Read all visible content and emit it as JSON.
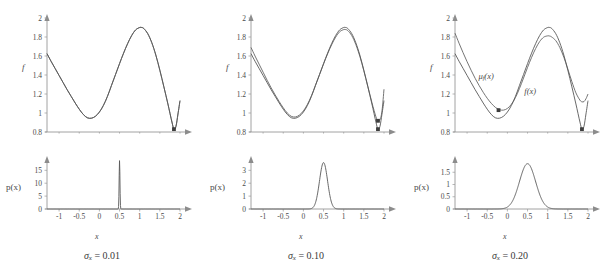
{
  "figure": {
    "panels": [
      {
        "caption_symbol": "σ",
        "caption_subscript": "x",
        "caption_equals": "=",
        "caption_value": "0.01",
        "sigma": 0.01,
        "f_axis_label": "f",
        "p_axis_label": "p(x)",
        "x_axis_label": "x"
      },
      {
        "caption_symbol": "σ",
        "caption_subscript": "x",
        "caption_equals": "=",
        "caption_value": "0.10",
        "sigma": 0.1,
        "f_axis_label": "f",
        "p_axis_label": "p(x)",
        "x_axis_label": "x"
      },
      {
        "caption_symbol": "σ",
        "caption_subscript": "x",
        "caption_equals": "=",
        "caption_value": "0.20",
        "sigma": 0.2,
        "f_axis_label": "f",
        "p_axis_label": "p(x)",
        "x_axis_label": "x"
      }
    ],
    "curve_labels": {
      "mu": "μ",
      "mu_subscript": "f",
      "mu_arg": "(x)",
      "f": "f(x)"
    },
    "colors": {
      "curve": "#585858",
      "axis": "#8c8c8c",
      "text": "#4a4a4a",
      "marker": "#3d3d3d",
      "background": "#ffffff"
    }
  },
  "chart_data": [
    {
      "type": "line",
      "panel": 1,
      "subplot": "f",
      "title": "",
      "xlabel": "x",
      "ylabel": "f",
      "xlim": [
        -1.3,
        2.0
      ],
      "ylim": [
        0.8,
        2.0
      ],
      "xticks": [
        -1,
        -0.5,
        0,
        0.5,
        1,
        1.5,
        2
      ],
      "yticks": [
        0.8,
        1,
        1.2,
        1.4,
        1.6,
        1.8,
        2
      ],
      "xticklabels": [
        "-1",
        "-0.5",
        "0",
        "0.5",
        "1",
        "1.5",
        "2"
      ],
      "yticklabels": [
        "0.8",
        "1",
        "1.2",
        "1.4",
        "1.6",
        "1.8",
        "2"
      ],
      "grid": false,
      "legend": false,
      "series": [
        {
          "name": "f(x)",
          "x": [
            -1.3,
            -1.2,
            -1.1,
            -1.0,
            -0.9,
            -0.8,
            -0.7,
            -0.6,
            -0.5,
            -0.4,
            -0.3,
            -0.2,
            -0.1,
            0.0,
            0.1,
            0.2,
            0.3,
            0.4,
            0.5,
            0.6,
            0.7,
            0.8,
            0.9,
            1.0,
            1.05,
            1.1,
            1.2,
            1.3,
            1.4,
            1.5,
            1.6,
            1.7,
            1.8,
            1.85,
            1.9,
            1.95,
            2.0
          ],
          "values": [
            1.625,
            1.545,
            1.47,
            1.395,
            1.32,
            1.245,
            1.175,
            1.105,
            1.04,
            0.985,
            0.95,
            0.945,
            0.965,
            1.01,
            1.08,
            1.175,
            1.29,
            1.405,
            1.52,
            1.63,
            1.73,
            1.815,
            1.875,
            1.9,
            1.9,
            1.89,
            1.835,
            1.74,
            1.61,
            1.45,
            1.275,
            1.095,
            0.905,
            0.83,
            0.86,
            0.99,
            1.13
          ]
        },
        {
          "name": "μ_f(x)",
          "x": [
            -1.3,
            -1.2,
            -1.1,
            -1.0,
            -0.9,
            -0.8,
            -0.7,
            -0.6,
            -0.5,
            -0.4,
            -0.3,
            -0.2,
            -0.1,
            0.0,
            0.1,
            0.2,
            0.3,
            0.4,
            0.5,
            0.6,
            0.7,
            0.8,
            0.9,
            1.0,
            1.05,
            1.1,
            1.2,
            1.3,
            1.4,
            1.5,
            1.6,
            1.7,
            1.8,
            1.85,
            1.9,
            1.95,
            2.0
          ],
          "values": [
            1.625,
            1.545,
            1.47,
            1.395,
            1.32,
            1.245,
            1.175,
            1.105,
            1.04,
            0.985,
            0.95,
            0.945,
            0.965,
            1.01,
            1.08,
            1.175,
            1.29,
            1.405,
            1.52,
            1.63,
            1.73,
            1.815,
            1.875,
            1.9,
            1.9,
            1.89,
            1.835,
            1.74,
            1.61,
            1.45,
            1.275,
            1.095,
            0.905,
            0.83,
            0.86,
            0.99,
            1.13
          ]
        }
      ],
      "markers": [
        {
          "x": 1.85,
          "y": 0.83,
          "label": "global-minimum"
        }
      ]
    },
    {
      "type": "line",
      "panel": 1,
      "subplot": "p",
      "title": "",
      "xlabel": "x",
      "ylabel": "p(x)",
      "xlim": [
        -1.3,
        2.0
      ],
      "ylim": [
        0,
        19
      ],
      "xticks": [
        -1,
        -0.5,
        0,
        0.5,
        1,
        1.5,
        2
      ],
      "yticks": [
        0,
        5,
        10,
        15
      ],
      "xticklabels": [
        "-1",
        "-0.5",
        "0",
        "0.5",
        "1",
        "1.5",
        "2"
      ],
      "yticklabels": [
        "0",
        "5",
        "10",
        "15"
      ],
      "grid": false,
      "legend": false,
      "distribution": "gaussian",
      "mean": 0.5,
      "sigma": 0.01,
      "peak": 18.8
    },
    {
      "type": "line",
      "panel": 2,
      "subplot": "f",
      "title": "",
      "xlabel": "x",
      "ylabel": "f",
      "xlim": [
        -1.3,
        2.0
      ],
      "ylim": [
        0.8,
        2.0
      ],
      "xticks": [
        -1,
        -0.5,
        0,
        0.5,
        1,
        1.5,
        2
      ],
      "yticks": [
        0.8,
        1,
        1.2,
        1.4,
        1.6,
        1.8,
        2
      ],
      "xticklabels": [
        "-1",
        "-0.5",
        "0",
        "0.5",
        "1",
        "1.5",
        "2"
      ],
      "yticklabels": [
        "0.8",
        "1",
        "1.2",
        "1.4",
        "1.6",
        "1.8",
        "2"
      ],
      "grid": false,
      "legend": false,
      "series": [
        {
          "name": "f(x)",
          "x": [
            -1.3,
            -1.2,
            -1.1,
            -1.0,
            -0.9,
            -0.8,
            -0.7,
            -0.6,
            -0.5,
            -0.4,
            -0.3,
            -0.2,
            -0.1,
            0.0,
            0.1,
            0.2,
            0.3,
            0.4,
            0.5,
            0.6,
            0.7,
            0.8,
            0.9,
            1.0,
            1.05,
            1.1,
            1.2,
            1.3,
            1.4,
            1.5,
            1.6,
            1.7,
            1.8,
            1.85,
            1.9,
            1.95,
            2.0
          ],
          "values": [
            1.625,
            1.545,
            1.47,
            1.395,
            1.32,
            1.245,
            1.175,
            1.105,
            1.04,
            0.985,
            0.95,
            0.945,
            0.965,
            1.01,
            1.08,
            1.175,
            1.29,
            1.405,
            1.52,
            1.63,
            1.73,
            1.815,
            1.875,
            1.9,
            1.9,
            1.89,
            1.835,
            1.74,
            1.61,
            1.45,
            1.275,
            1.095,
            0.905,
            0.83,
            0.86,
            0.99,
            1.13
          ]
        },
        {
          "name": "μ_f(x)",
          "x": [
            -1.3,
            -1.2,
            -1.1,
            -1.0,
            -0.9,
            -0.8,
            -0.7,
            -0.6,
            -0.5,
            -0.4,
            -0.3,
            -0.2,
            -0.1,
            0.0,
            0.1,
            0.2,
            0.3,
            0.4,
            0.5,
            0.6,
            0.7,
            0.8,
            0.9,
            1.0,
            1.05,
            1.1,
            1.2,
            1.3,
            1.4,
            1.5,
            1.6,
            1.7,
            1.8,
            1.85,
            1.9,
            1.95,
            2.0
          ],
          "values": [
            1.69,
            1.6,
            1.515,
            1.43,
            1.345,
            1.265,
            1.19,
            1.12,
            1.055,
            1.0,
            0.965,
            0.958,
            0.978,
            1.022,
            1.09,
            1.182,
            1.292,
            1.404,
            1.516,
            1.622,
            1.718,
            1.798,
            1.855,
            1.878,
            1.878,
            1.868,
            1.815,
            1.722,
            1.597,
            1.444,
            1.278,
            1.11,
            0.96,
            0.918,
            0.93,
            1.02,
            1.25
          ]
        }
      ],
      "markers": [
        {
          "x": 1.85,
          "y": 0.83,
          "label": "f-global-minimum"
        },
        {
          "x": 1.85,
          "y": 0.918,
          "label": "mu-global-minimum"
        }
      ]
    },
    {
      "type": "line",
      "panel": 2,
      "subplot": "p",
      "title": "",
      "xlabel": "x",
      "ylabel": "p(x)",
      "xlim": [
        -1.3,
        2.0
      ],
      "ylim": [
        0,
        3.8
      ],
      "xticks": [
        -1,
        -0.5,
        0,
        0.5,
        1,
        1.5,
        2
      ],
      "yticks": [
        0,
        1,
        2,
        3
      ],
      "xticklabels": [
        "-1",
        "-0.5",
        "0",
        "0.5",
        "1",
        "1.5",
        "2"
      ],
      "yticklabels": [
        "0",
        "1",
        "2",
        "3"
      ],
      "grid": false,
      "legend": false,
      "distribution": "gaussian",
      "mean": 0.5,
      "sigma": 0.1,
      "peak": 3.6
    },
    {
      "type": "line",
      "panel": 3,
      "subplot": "f",
      "title": "",
      "xlabel": "x",
      "ylabel": "f",
      "xlim": [
        -1.3,
        2.0
      ],
      "ylim": [
        0.8,
        2.0
      ],
      "xticks": [
        -1,
        -0.5,
        0,
        0.5,
        1,
        1.5,
        2
      ],
      "yticks": [
        0.8,
        1,
        1.2,
        1.4,
        1.6,
        1.8,
        2
      ],
      "xticklabels": [
        "-1",
        "-0.5",
        "0",
        "0.5",
        "1",
        "1.5",
        "2"
      ],
      "yticklabels": [
        "0.8",
        "1",
        "1.2",
        "1.4",
        "1.6",
        "1.8",
        "2"
      ],
      "grid": false,
      "legend": true,
      "annotations": [
        {
          "text": "μ_f(x)",
          "x": -0.72,
          "y": 1.36
        },
        {
          "text": "f(x)",
          "x": 0.42,
          "y": 1.2
        }
      ],
      "series": [
        {
          "name": "f(x)",
          "x": [
            -1.3,
            -1.2,
            -1.1,
            -1.0,
            -0.9,
            -0.8,
            -0.7,
            -0.6,
            -0.5,
            -0.4,
            -0.3,
            -0.2,
            -0.1,
            0.0,
            0.1,
            0.2,
            0.3,
            0.4,
            0.5,
            0.6,
            0.7,
            0.8,
            0.9,
            1.0,
            1.05,
            1.1,
            1.2,
            1.3,
            1.4,
            1.5,
            1.6,
            1.7,
            1.8,
            1.85,
            1.9,
            1.95,
            2.0
          ],
          "values": [
            1.625,
            1.545,
            1.47,
            1.395,
            1.32,
            1.245,
            1.175,
            1.105,
            1.04,
            0.985,
            0.95,
            0.945,
            0.965,
            1.01,
            1.08,
            1.175,
            1.29,
            1.405,
            1.52,
            1.63,
            1.73,
            1.815,
            1.875,
            1.9,
            1.9,
            1.89,
            1.835,
            1.74,
            1.61,
            1.45,
            1.275,
            1.095,
            0.905,
            0.83,
            0.86,
            0.99,
            1.13
          ]
        },
        {
          "name": "μ_f(x)",
          "x": [
            -1.3,
            -1.2,
            -1.1,
            -1.0,
            -0.9,
            -0.8,
            -0.7,
            -0.6,
            -0.5,
            -0.4,
            -0.3,
            -0.2,
            -0.1,
            0.0,
            0.1,
            0.2,
            0.3,
            0.4,
            0.5,
            0.6,
            0.7,
            0.8,
            0.9,
            1.0,
            1.05,
            1.1,
            1.2,
            1.3,
            1.4,
            1.5,
            1.6,
            1.7,
            1.8,
            1.85,
            1.9,
            1.95,
            2.0
          ],
          "values": [
            1.84,
            1.735,
            1.635,
            1.54,
            1.45,
            1.365,
            1.288,
            1.218,
            1.155,
            1.102,
            1.06,
            1.035,
            1.03,
            1.048,
            1.092,
            1.163,
            1.258,
            1.368,
            1.48,
            1.585,
            1.678,
            1.752,
            1.798,
            1.812,
            1.81,
            1.8,
            1.762,
            1.69,
            1.588,
            1.462,
            1.33,
            1.212,
            1.135,
            1.118,
            1.12,
            1.15,
            1.2
          ]
        }
      ],
      "markers": [
        {
          "x": 1.85,
          "y": 0.83,
          "label": "f-global-minimum"
        },
        {
          "x": -0.22,
          "y": 1.03,
          "label": "mu-global-minimum"
        }
      ]
    },
    {
      "type": "line",
      "panel": 3,
      "subplot": "p",
      "title": "",
      "xlabel": "x",
      "ylabel": "p(x)",
      "xlim": [
        -1.3,
        2.0
      ],
      "ylim": [
        0,
        2.0
      ],
      "xticks": [
        -1,
        -0.5,
        0,
        0.5,
        1,
        1.5,
        2
      ],
      "yticks": [
        0,
        0.5,
        1,
        1.5
      ],
      "xticklabels": [
        "-1",
        "-0.5",
        "0",
        "0.5",
        "1",
        "1.5",
        "2"
      ],
      "yticklabels": [
        "0",
        "0.5",
        "1",
        "1.5"
      ],
      "grid": false,
      "legend": false,
      "distribution": "gaussian",
      "mean": 0.5,
      "sigma": 0.2,
      "peak": 1.85
    }
  ]
}
